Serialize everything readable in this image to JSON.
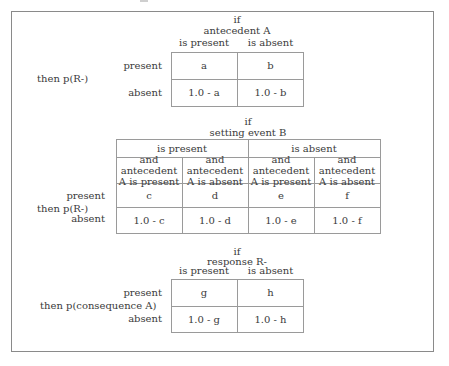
{
  "table1": {
    "condition_if": "if",
    "condition": "antecedent A",
    "col_headers": [
      "is present",
      "is absent"
    ],
    "row_label": "then p(R-)",
    "row_headers": [
      "present",
      "absent"
    ],
    "cells": [
      [
        "a",
        "b"
      ],
      [
        "1.0 - a",
        "1.0 - b"
      ]
    ]
  },
  "table2": {
    "condition_if": "if",
    "condition": "setting event B",
    "group_headers": [
      "is present",
      "is absent"
    ],
    "col_headers": [
      [
        "and antecedent",
        "A is present"
      ],
      [
        "and antecedent",
        "A is absent"
      ],
      [
        "and antecedent",
        "A is present"
      ],
      [
        "and antecedent",
        "A is absent"
      ]
    ],
    "row_label": "then p(R-)",
    "row_headers": [
      "present",
      "absent"
    ],
    "cells": [
      [
        "c",
        "d",
        "e",
        "f"
      ],
      [
        "1.0 - c",
        "1.0 - d",
        "1.0 - e",
        "1.0 - f"
      ]
    ]
  },
  "table3": {
    "condition_if": "if",
    "condition": "response R-",
    "col_headers": [
      "is present",
      "is absent"
    ],
    "row_label": "then p(consequence A)",
    "row_headers": [
      "present",
      "absent"
    ],
    "cells": [
      [
        "g",
        "h"
      ],
      [
        "1.0 - g",
        "1.0 - h"
      ]
    ]
  }
}
